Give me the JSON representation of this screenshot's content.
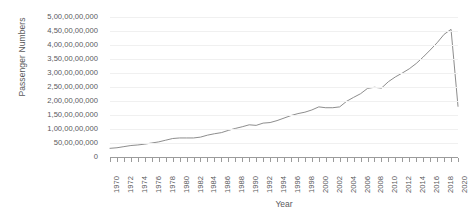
{
  "chart_data": {
    "type": "line",
    "title": "",
    "xlabel": "Year",
    "ylabel": "Passenger Numbers",
    "xlim": [
      1970,
      2020
    ],
    "ylim": [
      0,
      5000000000
    ],
    "grid": true,
    "legend": "none",
    "y_tick_labels": [
      "5,00,00,00,000",
      "4,50,00,00,000",
      "4,00,00,00,000",
      "3,50,00,00,000",
      "3,00,00,00,000",
      "2,50,00,00,000",
      "2,00,00,00,000",
      "1,50,00,00,000",
      "1,00,00,00,000",
      "50,00,00,000",
      "0"
    ],
    "y_tick_values": [
      5000000000,
      4500000000,
      4000000000,
      3500000000,
      3000000000,
      2500000000,
      2000000000,
      1500000000,
      1000000000,
      500000000,
      0
    ],
    "x_tick_labels": [
      "1970",
      "1972",
      "1974",
      "1976",
      "1978",
      "1980",
      "1982",
      "1984",
      "1986",
      "1988",
      "1990",
      "1992",
      "1994",
      "1996",
      "1998",
      "2000",
      "2002",
      "2004",
      "2006",
      "2008",
      "2010",
      "2012",
      "2014",
      "2016",
      "2018",
      "2020"
    ],
    "x_tick_interval": 2,
    "x_minor_tick_interval": 1,
    "series": [
      {
        "name": "Passenger Numbers",
        "color": "#808080",
        "x": [
          1970,
          1971,
          1972,
          1973,
          1974,
          1975,
          1976,
          1977,
          1978,
          1979,
          1980,
          1981,
          1982,
          1983,
          1984,
          1985,
          1986,
          1987,
          1988,
          1989,
          1990,
          1991,
          1992,
          1993,
          1994,
          1995,
          1996,
          1997,
          1998,
          1999,
          2000,
          2001,
          2002,
          2003,
          2004,
          2005,
          2006,
          2007,
          2008,
          2009,
          2010,
          2011,
          2012,
          2013,
          2014,
          2015,
          2016,
          2017,
          2018,
          2019,
          2020
        ],
        "values": [
          310000000,
          330000000,
          370000000,
          410000000,
          430000000,
          460000000,
          500000000,
          540000000,
          600000000,
          660000000,
          680000000,
          680000000,
          680000000,
          710000000,
          780000000,
          830000000,
          870000000,
          950000000,
          1020000000,
          1080000000,
          1150000000,
          1130000000,
          1210000000,
          1230000000,
          1300000000,
          1390000000,
          1480000000,
          1550000000,
          1600000000,
          1680000000,
          1790000000,
          1760000000,
          1760000000,
          1790000000,
          1990000000,
          2130000000,
          2260000000,
          2450000000,
          2490000000,
          2460000000,
          2690000000,
          2860000000,
          3000000000,
          3150000000,
          3340000000,
          3570000000,
          3820000000,
          4080000000,
          4380000000,
          4560000000,
          1810000000
        ]
      }
    ],
    "annotations": [
      {
        "label": "peak",
        "year": 2019,
        "value": 4560000000
      },
      {
        "label": "covid-drop",
        "year": 2020,
        "value": 1810000000
      }
    ]
  }
}
